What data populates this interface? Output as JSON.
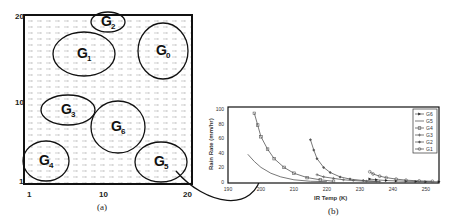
{
  "panel_a": {
    "caption": "(a)",
    "x_ticks": [
      "1",
      "10",
      "20"
    ],
    "y_ticks": [
      "1",
      "10",
      "20"
    ],
    "regions": [
      {
        "name": "G",
        "sub": "0",
        "cx": 163,
        "cy": 51,
        "rx": 25,
        "ry": 28
      },
      {
        "name": "G",
        "sub": "1",
        "cx": 84,
        "cy": 54,
        "rx": 31,
        "ry": 22
      },
      {
        "name": "G",
        "sub": "2",
        "cx": 108,
        "cy": 22,
        "rx": 17,
        "ry": 10
      },
      {
        "name": "G",
        "sub": "3",
        "cx": 68,
        "cy": 110,
        "rx": 27,
        "ry": 15
      },
      {
        "name": "G",
        "sub": "4",
        "cx": 46,
        "cy": 161,
        "rx": 23,
        "ry": 20
      },
      {
        "name": "G",
        "sub": "5",
        "cx": 161,
        "cy": 162,
        "rx": 26,
        "ry": 20
      },
      {
        "name": "G",
        "sub": "6",
        "cx": 118,
        "cy": 127,
        "rx": 27,
        "ry": 26
      }
    ]
  },
  "panel_b": {
    "caption": "(b)",
    "xlabel": "IR Temp (K)",
    "ylabel": "Rain Rate (mm/hr)"
  },
  "chart_data": {
    "type": "line",
    "title": "",
    "xlabel": "IR Temp (K)",
    "ylabel": "Rain Rate (mm/hr)",
    "xlim": [
      190,
      254
    ],
    "ylim": [
      0,
      100
    ],
    "x_ticks": [
      190,
      200,
      210,
      220,
      230,
      240,
      250
    ],
    "y_ticks": [
      0,
      20,
      40,
      60,
      80,
      100
    ],
    "legend": [
      "G6",
      "G5",
      "G4",
      "G3",
      "G2",
      "G1"
    ],
    "legend_position": "upper right",
    "series": [
      {
        "name": "G6",
        "marker": "triangle",
        "x": [
          233,
          235,
          238,
          241,
          244,
          247,
          250,
          254
        ],
        "y": [
          4,
          3,
          2,
          1.5,
          1,
          0.7,
          0.5,
          0.3
        ]
      },
      {
        "name": "G5",
        "marker": "none",
        "x": [
          196,
          198,
          200,
          203,
          206,
          210,
          215,
          220
        ],
        "y": [
          38,
          28,
          20,
          12,
          7,
          3,
          1,
          0.5
        ]
      },
      {
        "name": "G4",
        "marker": "square",
        "x": [
          198,
          199,
          200,
          202,
          204,
          207,
          210,
          214,
          218,
          222
        ],
        "y": [
          94,
          78,
          62,
          45,
          32,
          20,
          12,
          6,
          3,
          1
        ]
      },
      {
        "name": "G3",
        "marker": "plus",
        "x": [
          217,
          219,
          222,
          225,
          228,
          232,
          236
        ],
        "y": [
          10,
          7,
          5,
          3,
          2,
          1,
          0.5
        ]
      },
      {
        "name": "G2",
        "marker": "diamond",
        "x": [
          215,
          216,
          217,
          219,
          221,
          224,
          227,
          231,
          235
        ],
        "y": [
          58,
          44,
          32,
          20,
          13,
          7,
          4,
          2,
          1
        ]
      },
      {
        "name": "G1",
        "marker": "circle",
        "x": [
          233,
          234,
          236,
          238,
          241,
          244,
          248,
          252
        ],
        "y": [
          14,
          11,
          8,
          6,
          4,
          2.5,
          1.5,
          1
        ]
      }
    ]
  }
}
